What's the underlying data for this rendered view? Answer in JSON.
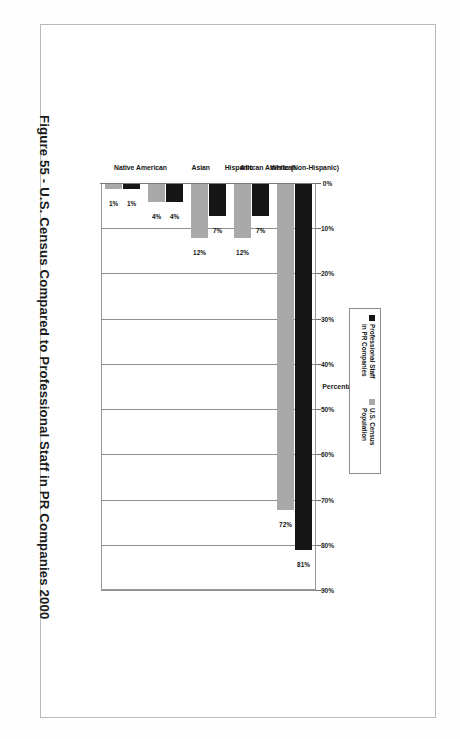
{
  "document": {
    "caption": "Figure 55 - U.S. Census Compared to Professional Staff in PR Companies 2000"
  },
  "legend": {
    "items": [
      {
        "label": "Professional Staff\nin PR Companies",
        "color": "#151515",
        "swatch_icon": "filled-square-icon"
      },
      {
        "label": "U.S. Census\nPopulation",
        "color": "#a9a9a9",
        "swatch_icon": "filled-square-icon"
      }
    ]
  },
  "axis": {
    "value_title": "Percentage",
    "ticks": [
      "0%",
      "10%",
      "20%",
      "30%",
      "40%",
      "50%",
      "60%",
      "70%",
      "80%",
      "90%"
    ]
  },
  "chart_data": {
    "type": "bar",
    "title": "Figure 55 - U.S. Census Compared to Professional Staff in PR Companies 2000",
    "categories": [
      "White (Non-Hispanic)",
      "African American",
      "Hispanic",
      "Asian",
      "Native American"
    ],
    "series": [
      {
        "name": "Professional Staff in PR Companies",
        "color": "#151515",
        "values": [
          81,
          7,
          7,
          4,
          1
        ],
        "labels": [
          "81%",
          "7%",
          "7%",
          "4%",
          "1%"
        ]
      },
      {
        "name": "U.S. Census Population",
        "color": "#a9a9a9",
        "values": [
          72,
          12,
          12,
          4,
          1
        ],
        "labels": [
          "72%",
          "12%",
          "12%",
          "4%",
          "1%"
        ]
      }
    ],
    "xlabel": "",
    "ylabel": "Percentage",
    "ylim": [
      0,
      90
    ],
    "ytick_step": 10,
    "grid": true,
    "legend_position": "inside-left",
    "orientation": "vertical-bars-rotated-90cw"
  }
}
